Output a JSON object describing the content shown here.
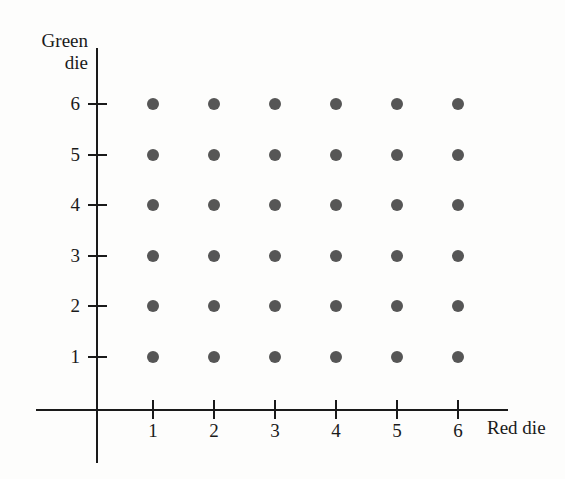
{
  "chart_data": {
    "type": "scatter",
    "title": "",
    "subtitle": "",
    "xlabel": "Red die",
    "ylabel_lines": [
      "Green",
      "die"
    ],
    "ylabel": "Green die",
    "xticks": [
      "1",
      "2",
      "3",
      "4",
      "5",
      "6"
    ],
    "yticks": [
      "1",
      "2",
      "3",
      "4",
      "5",
      "6"
    ],
    "xlim": [
      0,
      7
    ],
    "ylim": [
      0,
      7
    ],
    "grid": false,
    "legend": null,
    "point_count": 36,
    "point_color": "#565656",
    "axis_color": "#1a1a1a",
    "background_color": "#fdfdfc",
    "points": [
      {
        "x": 1,
        "y": 1
      },
      {
        "x": 2,
        "y": 1
      },
      {
        "x": 3,
        "y": 1
      },
      {
        "x": 4,
        "y": 1
      },
      {
        "x": 5,
        "y": 1
      },
      {
        "x": 6,
        "y": 1
      },
      {
        "x": 1,
        "y": 2
      },
      {
        "x": 2,
        "y": 2
      },
      {
        "x": 3,
        "y": 2
      },
      {
        "x": 4,
        "y": 2
      },
      {
        "x": 5,
        "y": 2
      },
      {
        "x": 6,
        "y": 2
      },
      {
        "x": 1,
        "y": 3
      },
      {
        "x": 2,
        "y": 3
      },
      {
        "x": 3,
        "y": 3
      },
      {
        "x": 4,
        "y": 3
      },
      {
        "x": 5,
        "y": 3
      },
      {
        "x": 6,
        "y": 3
      },
      {
        "x": 1,
        "y": 4
      },
      {
        "x": 2,
        "y": 4
      },
      {
        "x": 3,
        "y": 4
      },
      {
        "x": 4,
        "y": 4
      },
      {
        "x": 5,
        "y": 4
      },
      {
        "x": 6,
        "y": 4
      },
      {
        "x": 1,
        "y": 5
      },
      {
        "x": 2,
        "y": 5
      },
      {
        "x": 3,
        "y": 5
      },
      {
        "x": 4,
        "y": 5
      },
      {
        "x": 5,
        "y": 5
      },
      {
        "x": 6,
        "y": 5
      },
      {
        "x": 1,
        "y": 6
      },
      {
        "x": 2,
        "y": 6
      },
      {
        "x": 3,
        "y": 6
      },
      {
        "x": 4,
        "y": 6
      },
      {
        "x": 5,
        "y": 6
      },
      {
        "x": 6,
        "y": 6
      }
    ]
  },
  "geometry": {
    "x_origin_px": 97,
    "y_origin_px": 410,
    "x_step_px": 61,
    "y_step_px": 50.6,
    "x_first_px": 153,
    "y_first_px": 357
  }
}
